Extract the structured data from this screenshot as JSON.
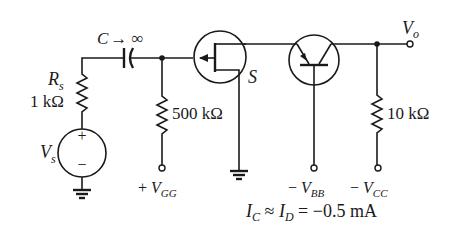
{
  "diagram": {
    "type": "circuit-schematic",
    "title": "",
    "labels": {
      "capacitor": "C → ∞",
      "source_resistor_name": "R",
      "source_resistor_sub": "s",
      "source_resistor_value": "1 kΩ",
      "source_name": "V",
      "source_sub": "s",
      "source_plus": "+",
      "source_minus": "−",
      "gate_resistor_value": "500 kΩ",
      "vgg_prefix": "+ ",
      "vgg_name": "V",
      "vgg_sub": "GG",
      "mosfet_source_label": "S",
      "vbb_prefix": "− ",
      "vbb_name": "V",
      "vbb_sub": "BB",
      "load_resistor_value": "10 kΩ",
      "vcc_prefix": "− ",
      "vcc_name": "V",
      "vcc_sub": "CC",
      "output_name": "V",
      "output_sub": "o",
      "equation_ic": "I",
      "equation_ic_sub": "C",
      "equation_approx": " ≈ ",
      "equation_id": "I",
      "equation_id_sub": "D",
      "equation_rhs": " =  −0.5 mA"
    },
    "components": [
      {
        "id": "Vs",
        "kind": "ac-voltage-source",
        "label": "Vs"
      },
      {
        "id": "Rs",
        "kind": "resistor",
        "value": "1 kΩ"
      },
      {
        "id": "C",
        "kind": "capacitor",
        "value": "C → ∞"
      },
      {
        "id": "RG",
        "kind": "resistor",
        "value": "500 kΩ",
        "to": "+VGG"
      },
      {
        "id": "M1",
        "kind": "p-channel-mosfet",
        "source_label": "S"
      },
      {
        "id": "Q1",
        "kind": "pnp-bjt",
        "base_to": "−VBB"
      },
      {
        "id": "RC",
        "kind": "resistor",
        "value": "10 kΩ",
        "to": "−VCC"
      },
      {
        "id": "Vo",
        "kind": "output-terminal",
        "label": "Vo"
      }
    ],
    "note": "IC ≈ ID = −0.5 mA"
  }
}
